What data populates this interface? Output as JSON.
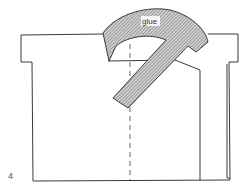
{
  "diagram": {
    "step_number": "4",
    "glue_label": "glue",
    "colors": {
      "outline": "#3a3a3a",
      "hatch": "#8a8a8a",
      "background": "#ffffff"
    }
  }
}
